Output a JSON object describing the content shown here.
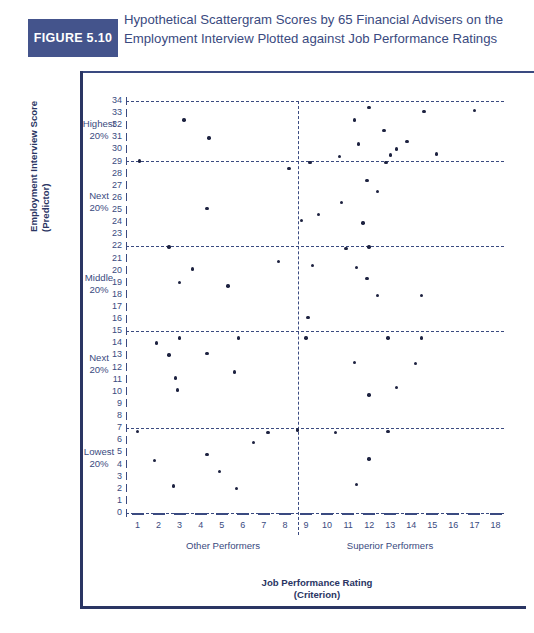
{
  "figure": {
    "badge": "FIGURE 5.10",
    "caption": "Hypothetical Scattergram Scores by 65 Financial Advisers on the Employment Interview Plotted against Job Performance Ratings"
  },
  "colors": {
    "badge_bg": "#44548c",
    "ink": "#2a3563",
    "caption": "#3a4a80",
    "dot": "#1d2240"
  },
  "axis_titles": {
    "y_line1": "Employment Interview Score",
    "y_line2": "(Predictor)",
    "x_line1": "Job Performance Rating",
    "x_line2": "(Criterion)"
  },
  "bands": [
    {
      "name": "Highest",
      "pct": "20%"
    },
    {
      "name": "Next",
      "pct": "20%"
    },
    {
      "name": "Middle",
      "pct": "20%"
    },
    {
      "name": "Next",
      "pct": "20%"
    },
    {
      "name": "Lowest",
      "pct": "20%"
    }
  ],
  "groups": [
    {
      "label": "Other Performers"
    },
    {
      "label": "Superior Performers"
    }
  ],
  "chart_data": {
    "type": "scatter",
    "title": "Hypothetical Scattergram Scores by 65 Financial Advisers on the Employment Interview Plotted against Job Performance Ratings",
    "xlabel": "Job Performance Rating (Criterion)",
    "ylabel": "Employment Interview Score (Predictor)",
    "xlim": [
      0,
      18
    ],
    "ylim": [
      0,
      34
    ],
    "xticks": [
      1,
      2,
      3,
      4,
      5,
      6,
      7,
      8,
      9,
      10,
      11,
      12,
      13,
      14,
      15,
      16,
      17,
      18
    ],
    "yticks": [
      0,
      1,
      2,
      3,
      4,
      5,
      6,
      7,
      8,
      9,
      10,
      11,
      12,
      13,
      14,
      15,
      16,
      17,
      18,
      19,
      20,
      21,
      22,
      23,
      24,
      25,
      26,
      27,
      28,
      29,
      30,
      31,
      32,
      33,
      34
    ],
    "grid": false,
    "legend": "none",
    "n_points": 65,
    "reference_lines": {
      "horizontal": [
        7,
        15,
        22,
        29,
        34
      ],
      "vertical": [
        8.6
      ]
    },
    "points": [
      [
        3.2,
        32.4
      ],
      [
        4.4,
        30.9
      ],
      [
        1.1,
        29.0
      ],
      [
        8.2,
        28.4
      ],
      [
        9.2,
        28.9
      ],
      [
        4.3,
        25.1
      ],
      [
        8.8,
        24.1
      ],
      [
        9.6,
        24.6
      ],
      [
        2.5,
        21.9
      ],
      [
        7.7,
        20.7
      ],
      [
        3.6,
        20.1
      ],
      [
        3.0,
        19.0
      ],
      [
        5.3,
        18.7
      ],
      [
        1.9,
        14.0
      ],
      [
        3.0,
        14.4
      ],
      [
        5.8,
        14.4
      ],
      [
        2.5,
        13.0
      ],
      [
        4.3,
        13.1
      ],
      [
        5.6,
        11.6
      ],
      [
        2.8,
        11.1
      ],
      [
        2.9,
        10.1
      ],
      [
        1.0,
        6.7
      ],
      [
        7.2,
        6.6
      ],
      [
        6.5,
        5.8
      ],
      [
        4.3,
        4.8
      ],
      [
        1.8,
        4.3
      ],
      [
        4.9,
        3.4
      ],
      [
        2.7,
        2.2
      ],
      [
        5.7,
        2.0
      ],
      [
        12.0,
        33.4
      ],
      [
        14.6,
        33.1
      ],
      [
        17.0,
        33.2
      ],
      [
        11.3,
        32.4
      ],
      [
        12.7,
        31.5
      ],
      [
        11.5,
        30.4
      ],
      [
        13.8,
        30.6
      ],
      [
        10.6,
        29.4
      ],
      [
        13.0,
        29.5
      ],
      [
        13.3,
        30.0
      ],
      [
        15.2,
        29.6
      ],
      [
        12.8,
        28.9
      ],
      [
        11.9,
        27.4
      ],
      [
        12.4,
        26.5
      ],
      [
        10.7,
        25.6
      ],
      [
        11.7,
        23.9
      ],
      [
        10.9,
        21.8
      ],
      [
        12.0,
        21.9
      ],
      [
        9.3,
        20.4
      ],
      [
        11.4,
        20.2
      ],
      [
        11.9,
        19.3
      ],
      [
        12.4,
        17.9
      ],
      [
        14.5,
        17.9
      ],
      [
        9.1,
        16.1
      ],
      [
        9.0,
        14.4
      ],
      [
        12.9,
        14.4
      ],
      [
        14.5,
        14.4
      ],
      [
        11.3,
        12.4
      ],
      [
        14.2,
        12.3
      ],
      [
        13.3,
        10.3
      ],
      [
        12.0,
        9.7
      ],
      [
        10.4,
        6.6
      ],
      [
        12.9,
        6.7
      ],
      [
        12.0,
        4.4
      ],
      [
        11.4,
        2.3
      ],
      [
        8.6,
        6.8
      ]
    ]
  }
}
